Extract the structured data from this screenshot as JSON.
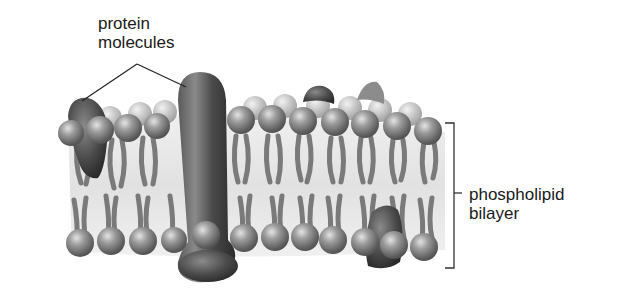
{
  "diagram": {
    "labels": {
      "protein": {
        "line1": "protein",
        "line2": "molecules"
      },
      "bilayer": {
        "line1": "phospholipid",
        "line2": "bilayer"
      }
    },
    "colors": {
      "background": "#ffffff",
      "text": "#1a1a1a",
      "leader_line": "#222222",
      "phospholipid_head": "#8a8a8a",
      "phospholipid_tail": "#7a7a7a",
      "protein": "#4a4a4a",
      "membrane_interior": "#e6e6e6"
    },
    "components": [
      "integral protein (tall, spans bilayer)",
      "peripheral protein (upper left)",
      "protein (upper middle-right)",
      "protein (lower right)",
      "phospholipid heads (top layer)",
      "phospholipid heads (bottom layer)",
      "fatty acid tails"
    ]
  }
}
